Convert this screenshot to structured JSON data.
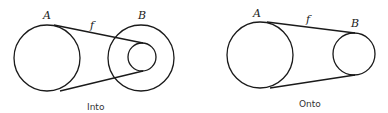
{
  "diagrams": [
    {
      "caption": "Into",
      "domain_label": "A",
      "codomain_label": "B",
      "function_label": "f"
    },
    {
      "caption": "Onto",
      "domain_label": "A",
      "codomain_label": "B",
      "function_label": "f"
    }
  ],
  "colors": {
    "stroke": "#1a1a1a",
    "background": "#ffffff"
  }
}
